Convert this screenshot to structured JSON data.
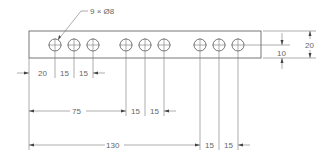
{
  "drawing": {
    "callout": "9 × Ø8",
    "plate_height_label": "20",
    "hole_row_offset_label": "10",
    "row1": {
      "first": "20",
      "second": "15",
      "third": "15"
    },
    "row2": {
      "first": "75",
      "second": "15",
      "third": "15"
    },
    "row3": {
      "first": "130",
      "second": "15",
      "third": "15"
    }
  },
  "colors": {
    "line": "#555555",
    "text": "#666666",
    "background": "#ffffff"
  }
}
